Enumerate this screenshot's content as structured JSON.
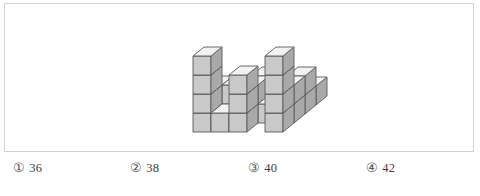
{
  "figure": {
    "caption": "",
    "colors": {
      "panel_border": "#d2d2d2",
      "cube_top": "#f2f2f2",
      "cube_front": "#c9c9c9",
      "cube_side": "#a9a9a9",
      "cube_edge": "#5a5a5a",
      "background": "#ffffff"
    },
    "cube_geometry": {
      "face_width": 18,
      "face_height": 19,
      "iso_dx": 11,
      "iso_dy": -9,
      "origin_x": 188,
      "origin_y": 128
    },
    "height_map": [
      [
        4,
        1,
        3,
        0,
        4
      ],
      [
        2,
        2,
        2,
        1,
        2
      ],
      [
        1,
        1,
        2,
        1,
        2
      ],
      [
        1,
        1,
        1,
        1,
        1
      ]
    ],
    "total_cubes": 40
  },
  "options": {
    "items": [
      {
        "marker": "①",
        "label": "36"
      },
      {
        "marker": "②",
        "label": "38"
      },
      {
        "marker": "③",
        "label": "40"
      },
      {
        "marker": "④",
        "label": "42"
      }
    ]
  }
}
